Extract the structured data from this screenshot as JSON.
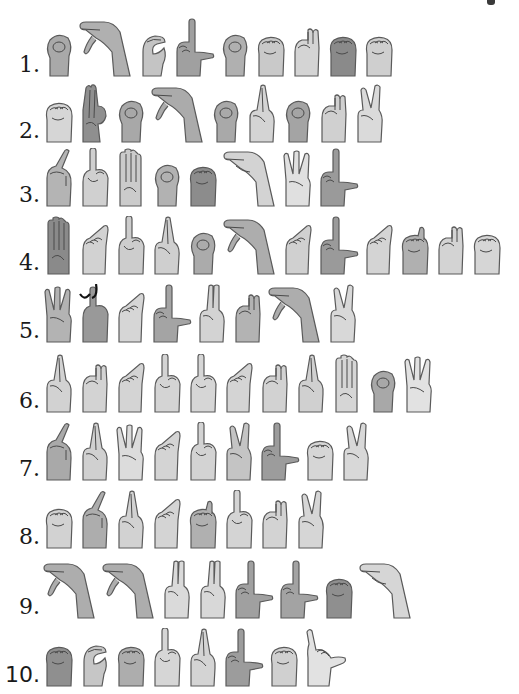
{
  "worksheet": {
    "type": "fingerspelling-puzzle",
    "rows": [
      {
        "number": "1.",
        "top": 14,
        "hands": [
          {
            "letter": "O",
            "shape": "o",
            "shade": "#a9a9a9"
          },
          {
            "letter": "P",
            "shape": "p",
            "shade": "#b0b0b0"
          },
          {
            "letter": "C",
            "shape": "c",
            "shade": "#c4c4c4"
          },
          {
            "letter": "L",
            "shape": "l",
            "shade": "#a0a0a0"
          },
          {
            "letter": "O",
            "shape": "o",
            "shade": "#b0b0b0"
          },
          {
            "letter": "S",
            "shape": "s",
            "shade": "#c9c9c9"
          },
          {
            "letter": "N",
            "shape": "n",
            "shade": "#d4d4d4"
          },
          {
            "letter": "S",
            "shape": "s",
            "shade": "#8a8a8a"
          },
          {
            "letter": "S",
            "shape": "s",
            "shade": "#cfcfcf"
          }
        ]
      },
      {
        "number": "2.",
        "top": 80,
        "hands": [
          {
            "letter": "S",
            "shape": "s",
            "shade": "#d6d6d6"
          },
          {
            "letter": "F",
            "shape": "f",
            "shade": "#8f8f8f"
          },
          {
            "letter": "O",
            "shape": "o",
            "shade": "#a8a8a8"
          },
          {
            "letter": "P",
            "shape": "p",
            "shade": "#ababab"
          },
          {
            "letter": "O",
            "shape": "o",
            "shade": "#a9a9a9"
          },
          {
            "letter": "R",
            "shape": "r",
            "shade": "#d4d4d4"
          },
          {
            "letter": "O",
            "shape": "o",
            "shade": "#a4a4a4"
          },
          {
            "letter": "N",
            "shape": "n",
            "shade": "#d0d0d0"
          },
          {
            "letter": "K",
            "shape": "k",
            "shade": "#dadada"
          }
        ]
      },
      {
        "number": "3.",
        "top": 144,
        "hands": [
          {
            "letter": "X",
            "shape": "x",
            "shade": "#b4b4b4"
          },
          {
            "letter": "I",
            "shape": "i",
            "shade": "#d0d0d0"
          },
          {
            "letter": "B",
            "shape": "b",
            "shade": "#cbcbcb"
          },
          {
            "letter": "O",
            "shape": "o",
            "shade": "#b2b2b2"
          },
          {
            "letter": "S",
            "shape": "s",
            "shade": "#8c8c8c"
          },
          {
            "letter": "H",
            "shape": "h",
            "shade": "#d3d3d3"
          },
          {
            "letter": "W",
            "shape": "w",
            "shade": "#e0e0e0"
          },
          {
            "letter": "L",
            "shape": "l",
            "shade": "#9a9a9a"
          }
        ]
      },
      {
        "number": "4.",
        "top": 212,
        "hands": [
          {
            "letter": "B",
            "shape": "b",
            "shade": "#8a8a8a"
          },
          {
            "letter": "A",
            "shape": "a",
            "shade": "#d2d2d2"
          },
          {
            "letter": "I",
            "shape": "i",
            "shade": "#cdcdcd"
          },
          {
            "letter": "R",
            "shape": "r",
            "shade": "#cfcfcf"
          },
          {
            "letter": "O",
            "shape": "o",
            "shade": "#ababab"
          },
          {
            "letter": "P",
            "shape": "p",
            "shade": "#adadad"
          },
          {
            "letter": "A",
            "shape": "a",
            "shade": "#d0d0d0"
          },
          {
            "letter": "L",
            "shape": "l",
            "shade": "#9a9a9a"
          },
          {
            "letter": "A",
            "shape": "a",
            "shade": "#d4d4d4"
          },
          {
            "letter": "T",
            "shape": "t",
            "shade": "#b0b0b0"
          },
          {
            "letter": "N",
            "shape": "n",
            "shade": "#d3d3d3"
          },
          {
            "letter": "S",
            "shape": "s",
            "shade": "#d6d6d6"
          }
        ]
      },
      {
        "number": "5.",
        "top": 280,
        "hands": [
          {
            "letter": "W",
            "shape": "w",
            "shade": "#b3b3b3"
          },
          {
            "letter": "J",
            "shape": "j",
            "shade": "#999999"
          },
          {
            "letter": "A",
            "shape": "a",
            "shade": "#d6d6d6"
          },
          {
            "letter": "L",
            "shape": "l",
            "shade": "#a4a4a4"
          },
          {
            "letter": "U",
            "shape": "u",
            "shade": "#d3d3d3"
          },
          {
            "letter": "N",
            "shape": "n",
            "shade": "#b3b3b3"
          },
          {
            "letter": "P",
            "shape": "p",
            "shade": "#adadad"
          },
          {
            "letter": "K",
            "shape": "k",
            "shade": "#d8d8d8"
          }
        ]
      },
      {
        "number": "6.",
        "top": 350,
        "hands": [
          {
            "letter": "R",
            "shape": "r",
            "shade": "#d2d2d2"
          },
          {
            "letter": "N",
            "shape": "n",
            "shade": "#d3d3d3"
          },
          {
            "letter": "A",
            "shape": "a",
            "shade": "#d4d4d4"
          },
          {
            "letter": "I",
            "shape": "i",
            "shade": "#d4d4d4"
          },
          {
            "letter": "I",
            "shape": "i",
            "shade": "#d6d6d6"
          },
          {
            "letter": "A",
            "shape": "a",
            "shade": "#d4d4d4"
          },
          {
            "letter": "N",
            "shape": "n",
            "shade": "#d2d2d2"
          },
          {
            "letter": "R",
            "shape": "r",
            "shade": "#d0d0d0"
          },
          {
            "letter": "B",
            "shape": "b",
            "shade": "#d6d6d6"
          },
          {
            "letter": "O",
            "shape": "o",
            "shade": "#a8a8a8"
          },
          {
            "letter": "W",
            "shape": "w",
            "shade": "#e2e2e2"
          }
        ]
      },
      {
        "number": "7.",
        "top": 418,
        "hands": [
          {
            "letter": "X",
            "shape": "x",
            "shade": "#a9a9a9"
          },
          {
            "letter": "R",
            "shape": "r",
            "shade": "#d0d0d0"
          },
          {
            "letter": "W",
            "shape": "w",
            "shade": "#dcdcdc"
          },
          {
            "letter": "A",
            "shape": "a",
            "shade": "#d4d4d4"
          },
          {
            "letter": "I",
            "shape": "i",
            "shade": "#d3d3d3"
          },
          {
            "letter": "V",
            "shape": "v",
            "shade": "#c4c4c4"
          },
          {
            "letter": "L",
            "shape": "l",
            "shade": "#9c9c9c"
          },
          {
            "letter": "S",
            "shape": "s",
            "shade": "#d6d6d6"
          },
          {
            "letter": "K",
            "shape": "k",
            "shade": "#d8d8d8"
          }
        ]
      },
      {
        "number": "8.",
        "top": 486,
        "hands": [
          {
            "letter": "S",
            "shape": "s",
            "shade": "#d2d2d2"
          },
          {
            "letter": "X",
            "shape": "x",
            "shade": "#adadad"
          },
          {
            "letter": "R",
            "shape": "r",
            "shade": "#d2d2d2"
          },
          {
            "letter": "A",
            "shape": "a",
            "shade": "#d4d4d4"
          },
          {
            "letter": "T",
            "shape": "t",
            "shade": "#b0b0b0"
          },
          {
            "letter": "I",
            "shape": "i",
            "shade": "#d4d4d4"
          },
          {
            "letter": "N",
            "shape": "n",
            "shade": "#d3d3d3"
          },
          {
            "letter": "K",
            "shape": "k",
            "shade": "#d6d6d6"
          }
        ]
      },
      {
        "number": "9.",
        "top": 556,
        "hands": [
          {
            "letter": "P",
            "shape": "p",
            "shade": "#adadad"
          },
          {
            "letter": "P",
            "shape": "p",
            "shade": "#adadad"
          },
          {
            "letter": "U",
            "shape": "u",
            "shade": "#dadada"
          },
          {
            "letter": "U",
            "shape": "u",
            "shade": "#d8d8d8"
          },
          {
            "letter": "L",
            "shape": "l",
            "shade": "#a0a0a0"
          },
          {
            "letter": "L",
            "shape": "l",
            "shade": "#a3a3a3"
          },
          {
            "letter": "S",
            "shape": "s",
            "shade": "#8f8f8f"
          },
          {
            "letter": "H",
            "shape": "h",
            "shade": "#d6d6d6"
          }
        ]
      },
      {
        "number": "10.",
        "top": 624,
        "sans": true,
        "hands": [
          {
            "letter": "S",
            "shape": "s",
            "shade": "#8f8f8f"
          },
          {
            "letter": "C",
            "shape": "c",
            "shade": "#c6c6c6"
          },
          {
            "letter": "S",
            "shape": "s",
            "shade": "#adadad"
          },
          {
            "letter": "I",
            "shape": "i",
            "shade": "#d6d6d6"
          },
          {
            "letter": "R",
            "shape": "r",
            "shade": "#d4d4d4"
          },
          {
            "letter": "L",
            "shape": "l",
            "shade": "#9c9c9c"
          },
          {
            "letter": "S",
            "shape": "s",
            "shade": "#d0d0d0"
          },
          {
            "letter": "Y",
            "shape": "y",
            "shade": "#e2e2e2"
          }
        ]
      }
    ]
  },
  "colors": {
    "outline": "#5a5a5a",
    "line": "#4a4a4a",
    "number_text": "#1a1a1a",
    "background": "#ffffff"
  }
}
